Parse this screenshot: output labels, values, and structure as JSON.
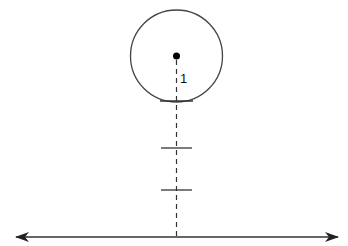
{
  "diagram": {
    "width": 348,
    "height": 246,
    "colors": {
      "background": "#ffffff",
      "stroke": "#333333",
      "dot": "#000000"
    },
    "circle": {
      "cx": 176.5,
      "cy": 56,
      "r": 46
    },
    "center_point": {
      "x": 176.5,
      "y": 56,
      "r": 3.5
    },
    "label": {
      "text": "1",
      "x": 180,
      "y": 83
    },
    "dashed_axis": {
      "x": 176.5,
      "y1": 60,
      "y2": 237,
      "dash": "5,4"
    },
    "ticks": [
      {
        "name": "tangent-tick",
        "y": 101,
        "x1": 160,
        "x2": 193
      },
      {
        "name": "tick-2",
        "y": 148,
        "x1": 161,
        "x2": 192
      },
      {
        "name": "tick-3",
        "y": 190,
        "x1": 161,
        "x2": 192
      }
    ],
    "baseline": {
      "y": 237,
      "x1": 16,
      "x2": 338,
      "arrows": "both"
    }
  }
}
